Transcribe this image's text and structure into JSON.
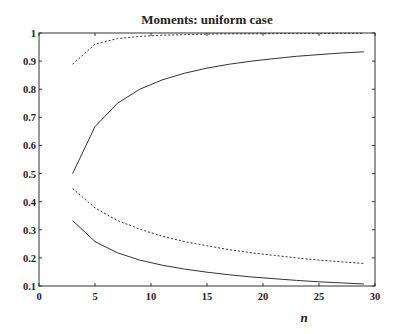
{
  "chart_data": {
    "type": "line",
    "title": "Moments: uniform case",
    "xlabel": "n",
    "ylabel": "",
    "xlim": [
      0,
      30
    ],
    "ylim": [
      0.1,
      1.0
    ],
    "xticks": [
      0,
      5,
      10,
      15,
      20,
      25,
      30
    ],
    "yticks": [
      0.1,
      0.2,
      0.3,
      0.4,
      0.5,
      0.6,
      0.7,
      0.8,
      0.9,
      1.0
    ],
    "ytick_labels": [
      "0.1",
      "0.2",
      "0.3",
      "0.4",
      "0.5",
      "0.6",
      "0.7",
      "0.8",
      "0.9",
      "1"
    ],
    "grid": false,
    "legend": null,
    "x": [
      3,
      5,
      7,
      9,
      11,
      13,
      15,
      17,
      19,
      21,
      23,
      25,
      27,
      29
    ],
    "series": [
      {
        "name": "upper-dashed",
        "style": "dashed",
        "values": [
          0.889,
          0.96,
          0.98,
          0.988,
          0.992,
          0.994,
          0.996,
          0.997,
          0.997,
          0.998,
          0.998,
          0.998,
          0.999,
          0.999
        ]
      },
      {
        "name": "upper-solid",
        "style": "solid",
        "values": [
          0.5,
          0.667,
          0.75,
          0.8,
          0.833,
          0.857,
          0.875,
          0.889,
          0.9,
          0.909,
          0.917,
          0.923,
          0.929,
          0.933
        ]
      },
      {
        "name": "lower-dashed",
        "style": "dashed",
        "values": [
          0.447,
          0.378,
          0.333,
          0.302,
          0.277,
          0.258,
          0.243,
          0.229,
          0.218,
          0.209,
          0.2,
          0.192,
          0.186,
          0.18
        ]
      },
      {
        "name": "lower-solid",
        "style": "solid",
        "values": [
          0.333,
          0.258,
          0.218,
          0.192,
          0.174,
          0.16,
          0.149,
          0.14,
          0.132,
          0.126,
          0.12,
          0.115,
          0.111,
          0.107
        ]
      }
    ]
  }
}
